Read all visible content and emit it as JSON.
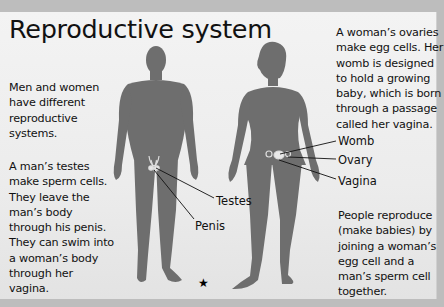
{
  "title": "Reproductive system",
  "paragraphs": {
    "intro": "Men and women have different reproductive systems.",
    "male": "A man’s testes make sperm cells. They leave the man’s body through his penis. They can swim into a woman’s body through her vagina.",
    "female": "A woman’s ovaries make egg cells. Her womb is designed to hold a growing baby, which is born through a passage called her vagina.",
    "reproduce": "People reproduce (make babies) by joining a woman’s egg cell and a man’s sperm cell together."
  },
  "labels": {
    "male": [
      "Testes",
      "Penis"
    ],
    "female": [
      "Womb",
      "Ovary",
      "Vagina"
    ]
  },
  "figures": {
    "male": "male-silhouette",
    "female": "female-silhouette"
  },
  "footer_icon": "★",
  "colors": {
    "background": "#bdbdbd",
    "panel": "#ececec",
    "silhouette": "#6e6e6e",
    "text": "#111111"
  }
}
